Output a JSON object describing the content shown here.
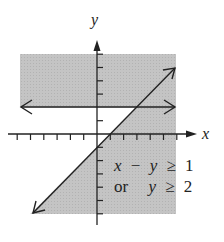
{
  "chart_data": {
    "type": "inequality-graph",
    "title": "",
    "xlabel": "x",
    "ylabel": "y",
    "xlim": [
      -6,
      7
    ],
    "ylim": [
      -6,
      6
    ],
    "grid": false,
    "tick_step": 1,
    "lines": [
      {
        "name": "boundary-1",
        "equation": "y = x - 1",
        "style": "solid",
        "arrows": "both"
      },
      {
        "name": "boundary-2",
        "equation": "y = 2",
        "style": "solid",
        "arrows": "both"
      }
    ],
    "shaded_region": "x - y >= 1 or y >= 2",
    "shade_color": "#bdbdbd",
    "annotation": {
      "line1": {
        "x": "x",
        "op": "−",
        "y": "y",
        "rel": "≥",
        "val": "1"
      },
      "line2": {
        "conj": "or",
        "y": "y",
        "rel": "≥",
        "val": "2"
      }
    }
  },
  "axes": {
    "x_label": "x",
    "y_label": "y"
  },
  "layout": {
    "origin": [
      97,
      134
    ],
    "unit": 13.3,
    "shade_box": {
      "left": 20,
      "top": 54,
      "right": 176,
      "bottom": 214
    }
  }
}
